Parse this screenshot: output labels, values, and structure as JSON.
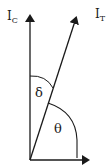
{
  "diagram": {
    "labels": {
      "ic": "I",
      "ic_sub": "C",
      "it": "I",
      "it_sub": "T",
      "delta": "δ",
      "theta": "θ"
    },
    "colors": {
      "line": "#1a1a1a",
      "background": "#ffffff"
    }
  }
}
